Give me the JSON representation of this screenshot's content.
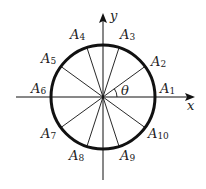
{
  "diagram": {
    "type": "unit-circle-division",
    "center": [
      103,
      97
    ],
    "radius": 52,
    "axes": {
      "x_label": "x",
      "y_label": "y",
      "x_range": [
        16,
        192
      ],
      "y_range": [
        14,
        180
      ]
    },
    "angle_label": "θ",
    "points": [
      {
        "name": "A",
        "index": "1",
        "angle_deg": 0
      },
      {
        "name": "A",
        "index": "2",
        "angle_deg": 36
      },
      {
        "name": "A",
        "index": "3",
        "angle_deg": 72
      },
      {
        "name": "A",
        "index": "4",
        "angle_deg": 108
      },
      {
        "name": "A",
        "index": "5",
        "angle_deg": 144
      },
      {
        "name": "A",
        "index": "6",
        "angle_deg": 180
      },
      {
        "name": "A",
        "index": "7",
        "angle_deg": 216
      },
      {
        "name": "A",
        "index": "8",
        "angle_deg": 252
      },
      {
        "name": "A",
        "index": "9",
        "angle_deg": 288
      },
      {
        "name": "A",
        "index": "10",
        "angle_deg": 324
      }
    ],
    "colors": {
      "stroke": "#111111",
      "background": "#ffffff"
    }
  }
}
